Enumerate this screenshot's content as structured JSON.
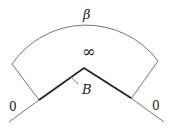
{
  "diagram": {
    "labels": {
      "beta": "β",
      "infinity": "∞",
      "boundary": "B",
      "left_zero": "0",
      "right_zero": "0"
    },
    "colors": {
      "line": "#555555",
      "thick_line": "#222222",
      "text": "#222222"
    }
  }
}
